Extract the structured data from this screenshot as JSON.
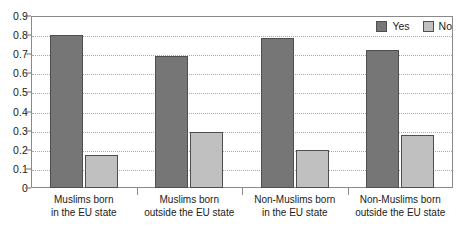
{
  "chart_data": {
    "type": "bar",
    "title": "",
    "subtitle": "",
    "xlabel": "",
    "ylabel": "",
    "ylim": [
      0,
      0.9
    ],
    "ytick_labels": [
      "0.9",
      "0.8",
      "0.7",
      "0.6",
      "0.5",
      "0.4",
      "0.3",
      "0.2",
      "0.1",
      "0"
    ],
    "ytick_values": [
      0.9,
      0.8,
      0.7,
      0.6,
      0.5,
      0.4,
      0.3,
      0.2,
      0.1,
      0
    ],
    "grid": true,
    "grid_axis": "y",
    "legend_position": "top-right",
    "categories": [
      {
        "line1": "Muslims born",
        "line2": "in the EU state"
      },
      {
        "line1": "Muslims born",
        "line2": "outside the EU state"
      },
      {
        "line1": "Non-Muslims born",
        "line2": "in the EU state"
      },
      {
        "line1": "Non-Muslims born",
        "line2": "outside the EU state"
      }
    ],
    "series": [
      {
        "name": "Yes",
        "color": "#767676",
        "values": [
          0.8,
          0.69,
          0.785,
          0.72
        ]
      },
      {
        "name": "No",
        "color": "#c0c0c0",
        "values": [
          0.175,
          0.295,
          0.2,
          0.275
        ]
      }
    ]
  },
  "legend": {
    "items": [
      {
        "label": "Yes",
        "swatch": "yes"
      },
      {
        "label": "No",
        "swatch": "no"
      }
    ]
  }
}
